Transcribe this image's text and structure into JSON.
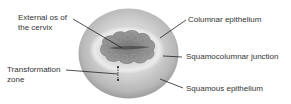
{
  "diagram": {
    "subject": "cervix",
    "labels": {
      "external_os": [
        "External os of",
        "the cervix"
      ],
      "transformation_zone": [
        "Transformation",
        "zone"
      ],
      "columnar_epithelium": "Columnar epithelium",
      "squamocolumnar_junction": "Squamocolumnar junction",
      "squamous_epithelium": "Squamous epithelium"
    },
    "colors": {
      "outer_surface": "#c8c8c8",
      "outer_rim": "#9a9a9a",
      "columnar_region": "#8a8a8a",
      "os_slit": "#555555",
      "leader_line": "#222222",
      "text": "#333333"
    }
  }
}
